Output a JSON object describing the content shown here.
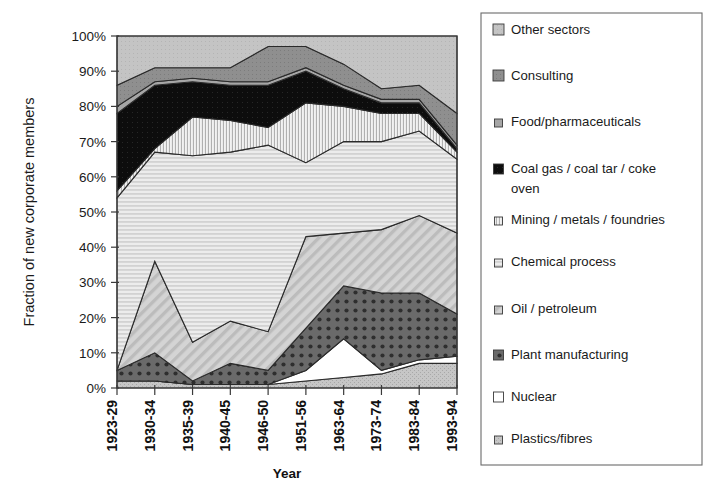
{
  "chart_data": {
    "type": "area",
    "stacked": true,
    "title": "",
    "xlabel": "Year",
    "ylabel": "Fraction of new corporate members",
    "categories": [
      "1923-29",
      "1930-34",
      "1935-39",
      "1940-45",
      "1946-50",
      "1951-56",
      "1963-64",
      "1973-74",
      "1983-84",
      "1993-94"
    ],
    "ylim": [
      0,
      100
    ],
    "ytick_labels": [
      "0%",
      "10%",
      "20%",
      "30%",
      "40%",
      "50%",
      "60%",
      "70%",
      "80%",
      "90%",
      "100%"
    ],
    "ytick_values": [
      0,
      10,
      20,
      30,
      40,
      50,
      60,
      70,
      80,
      90,
      100
    ],
    "grid": false,
    "legend_position": "right",
    "units": "percent",
    "series": [
      {
        "name": "Plastics/fibres",
        "values": [
          2,
          2,
          1,
          1,
          1,
          2,
          3,
          4,
          7,
          7
        ]
      },
      {
        "name": "Nuclear",
        "values": [
          0,
          0,
          0,
          0,
          0,
          3,
          11,
          1,
          1,
          2
        ]
      },
      {
        "name": "Plant manufacturing",
        "values": [
          3,
          8,
          1,
          6,
          4,
          12,
          15,
          22,
          19,
          12
        ]
      },
      {
        "name": "Oil / petroleum",
        "values": [
          0,
          26,
          11,
          12,
          11,
          26,
          15,
          18,
          22,
          23
        ]
      },
      {
        "name": "Chemical process",
        "values": [
          49,
          31,
          53,
          48,
          53,
          21,
          26,
          25,
          24,
          21
        ]
      },
      {
        "name": "Mining / metals / foundries",
        "values": [
          2,
          1,
          11,
          9,
          5,
          17,
          10,
          8,
          5,
          2
        ]
      },
      {
        "name": "Coal gas / coal tar / coke oven",
        "values": [
          22,
          18,
          10,
          10,
          12,
          9,
          5,
          3,
          3,
          1
        ]
      },
      {
        "name": "Food/pharmaceuticals",
        "values": [
          2,
          1,
          1,
          1,
          1,
          1,
          1,
          1,
          1,
          1
        ]
      },
      {
        "name": "Consulting",
        "values": [
          6,
          4,
          3,
          4,
          10,
          6,
          6,
          3,
          4,
          9
        ]
      },
      {
        "name": "Other sectors",
        "values": [
          14,
          9,
          9,
          9,
          3,
          3,
          8,
          15,
          14,
          22
        ]
      }
    ]
  },
  "legend": {
    "items": [
      {
        "label": "Other sectors",
        "swatch": "light-gray-solid"
      },
      {
        "label": "Consulting",
        "swatch": "mid-gray-solid"
      },
      {
        "label": "Food/pharmaceuticals",
        "swatch": "gray-small"
      },
      {
        "label": "Coal gas / coal tar / coke",
        "swatch": "black-solid"
      },
      {
        "label": "oven",
        "swatch": "none"
      },
      {
        "label": "Mining / metals / foundries",
        "swatch": "vertical-hatch"
      },
      {
        "label": "Chemical process",
        "swatch": "horizontal-hatch"
      },
      {
        "label": "Oil / petroleum",
        "swatch": "diagonal-hatch"
      },
      {
        "label": "Plant manufacturing",
        "swatch": "dark-dotted"
      },
      {
        "label": "Nuclear",
        "swatch": "white-solid"
      },
      {
        "label": "Plastics/fibres",
        "swatch": "light-gray-small"
      }
    ]
  },
  "colors": {
    "other_sectors": "#bfbfbf",
    "consulting": "#8c8c8c",
    "food_pharmaceuticals": "#b2b2b2",
    "coal_gas": "#0a0a0a",
    "mining": "#e6e6e6",
    "chemical_process": "#e2e2e2",
    "oil_petroleum": "#c9c9c9",
    "plant_manufacturing": "#5e5e5e",
    "nuclear": "#ffffff",
    "plastics_fibres": "#b9b9b9",
    "outline": "#2a2a2a",
    "legend_border": "#6b6b6b"
  }
}
